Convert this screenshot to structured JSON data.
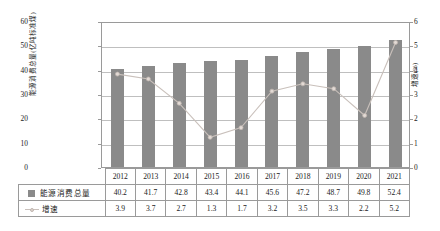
{
  "chart_data": {
    "type": "bar",
    "title": "",
    "subtitle": "",
    "xlabel": "",
    "ylabel": "能源消费总量(亿吨标准煤)",
    "y2label": "增速(%)",
    "categories": [
      "2012",
      "2013",
      "2014",
      "2015",
      "2016",
      "2017",
      "2018",
      "2019",
      "2020",
      "2021"
    ],
    "series": [
      {
        "name": "能源消费总量",
        "type": "bar",
        "axis": "left",
        "color": "#8a8a8a",
        "values": [
          40.2,
          41.7,
          42.8,
          43.4,
          44.1,
          45.6,
          47.2,
          48.7,
          49.8,
          52.4
        ]
      },
      {
        "name": "增速",
        "type": "line",
        "axis": "right",
        "color": "#c9c0bb",
        "values": [
          3.9,
          3.7,
          2.7,
          1.3,
          1.7,
          3.2,
          3.5,
          3.3,
          2.2,
          5.2
        ]
      }
    ],
    "ylim": [
      0,
      60
    ],
    "yticks": [
      0,
      10,
      20,
      30,
      40,
      50,
      60
    ],
    "y2lim": [
      0,
      6
    ],
    "y2ticks": [
      0,
      1,
      2,
      3,
      4,
      5,
      6
    ],
    "grid": true,
    "legend_position": "table-left"
  },
  "table": {
    "header_label": "",
    "years": [
      "2012",
      "2013",
      "2014",
      "2015",
      "2016",
      "2017",
      "2018",
      "2019",
      "2020",
      "2021"
    ],
    "rows": [
      {
        "label": "能源消费总量",
        "marker": "square-swatch",
        "values": [
          "40.2",
          "41.7",
          "42.8",
          "43.4",
          "44.1",
          "45.6",
          "47.2",
          "48.7",
          "49.8",
          "52.4"
        ]
      },
      {
        "label": "增速",
        "marker": "line-marker",
        "values": [
          "3.9",
          "3.7",
          "2.7",
          "1.3",
          "1.7",
          "3.2",
          "3.5",
          "3.3",
          "2.2",
          "5.2"
        ]
      }
    ]
  },
  "axes": {
    "left_title": "能源消费总量(亿吨标准煤)",
    "right_title": "增速(%)",
    "left_ticks": [
      "60",
      "50",
      "40",
      "30",
      "20",
      "10",
      "0"
    ],
    "right_ticks": [
      "6",
      "5",
      "4",
      "3",
      "2",
      "1",
      "0"
    ]
  }
}
